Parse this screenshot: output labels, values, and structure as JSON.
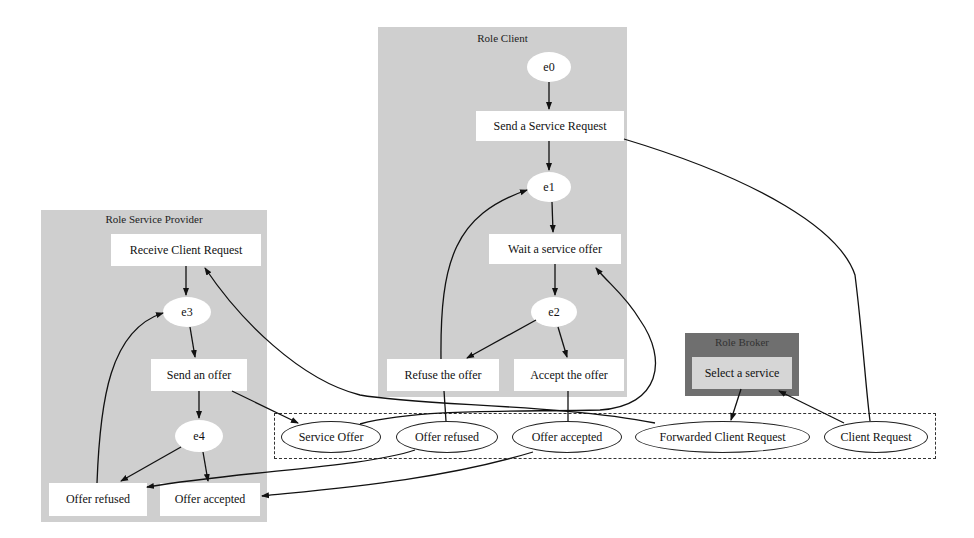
{
  "clusters": {
    "client": {
      "title": "Role Client",
      "states": [
        "e0",
        "e1",
        "e2"
      ],
      "actions": {
        "send_request": "Send a Service Request",
        "wait_offer": "Wait a service offer",
        "refuse": "Refuse the offer",
        "accept": "Accept the offer"
      }
    },
    "provider": {
      "title": "Role Service Provider",
      "states": [
        "e3",
        "e4"
      ],
      "actions": {
        "receive_request": "Receive Client Request",
        "send_offer": "Send an offer",
        "offer_refused": "Offer refused",
        "offer_accepted": "Offer accepted"
      }
    },
    "broker": {
      "title": "Role Broker",
      "actions": {
        "select_service": "Select a service"
      }
    }
  },
  "messages": [
    "Service Offer",
    "Offer refused",
    "Offer accepted",
    "Forwarded Client Request",
    "Client Request"
  ],
  "colors": {
    "cluster_fill": "#cfcfcf",
    "broker_fill": "#6f6f6f",
    "node_fill": "#ffffff",
    "edge": "#111111"
  }
}
